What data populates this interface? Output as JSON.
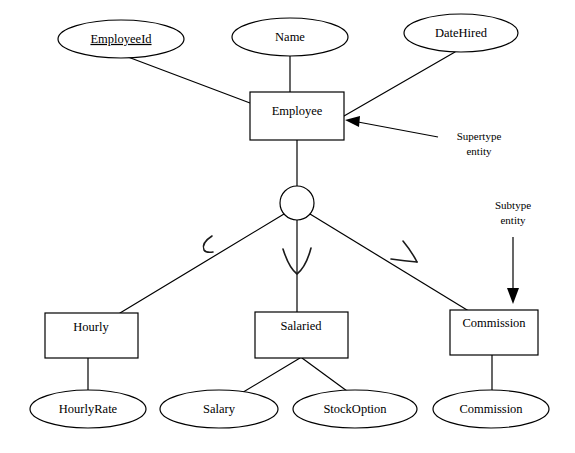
{
  "diagram": {
    "type": "er-diagram",
    "notation": "Chen / supertype-subtype generalization",
    "canvas": {
      "width": 575,
      "height": 453
    },
    "entities": [
      {
        "id": "employee",
        "label": "Employee",
        "role": "supertype",
        "shape": "rectangle",
        "x": 250,
        "y": 92,
        "w": 94,
        "h": 48
      },
      {
        "id": "hourly",
        "label": "Hourly",
        "role": "subtype",
        "shape": "rectangle",
        "x": 45,
        "y": 313,
        "w": 93,
        "h": 45
      },
      {
        "id": "salaried",
        "label": "Salaried",
        "role": "subtype",
        "shape": "rectangle",
        "x": 255,
        "y": 312,
        "w": 93,
        "h": 46
      },
      {
        "id": "commission",
        "label": "Commission",
        "role": "subtype",
        "shape": "rectangle",
        "x": 450,
        "y": 310,
        "w": 88,
        "h": 45
      }
    ],
    "attributes": [
      {
        "id": "employeeid",
        "label": "EmployeeId",
        "key": true,
        "owner": "employee",
        "shape": "ellipse",
        "cx": 121,
        "cy": 39,
        "rx": 63,
        "ry": 19
      },
      {
        "id": "name",
        "label": "Name",
        "key": false,
        "owner": "employee",
        "shape": "ellipse",
        "cx": 290,
        "cy": 37,
        "rx": 58,
        "ry": 19
      },
      {
        "id": "datehired",
        "label": "DateHired",
        "key": false,
        "owner": "employee",
        "shape": "ellipse",
        "cx": 461,
        "cy": 33,
        "rx": 57,
        "ry": 19
      },
      {
        "id": "hourlyrate",
        "label": "HourlyRate",
        "key": false,
        "owner": "hourly",
        "shape": "ellipse",
        "cx": 88,
        "cy": 409,
        "rx": 58,
        "ry": 19
      },
      {
        "id": "salary",
        "label": "Salary",
        "key": false,
        "owner": "salaried",
        "shape": "ellipse",
        "cx": 219,
        "cy": 409,
        "rx": 59,
        "ry": 19
      },
      {
        "id": "stockoption",
        "label": "StockOption",
        "key": false,
        "owner": "salaried",
        "shape": "ellipse",
        "cx": 355,
        "cy": 409,
        "rx": 62,
        "ry": 19
      },
      {
        "id": "commissionattr",
        "label": "Commission",
        "key": false,
        "owner": "commission",
        "shape": "ellipse",
        "cx": 491,
        "cy": 409,
        "rx": 58,
        "ry": 19
      }
    ],
    "generalization": {
      "id": "gen-circle",
      "shape": "circle",
      "cx": 297,
      "cy": 203,
      "r": 17,
      "subtype_marker": "subset-arc"
    },
    "annotations": [
      {
        "id": "supertype-note",
        "line1": "Supertype",
        "line2": "entity",
        "x": 479,
        "y": 143,
        "points_to": "employee"
      },
      {
        "id": "subtype-note",
        "line1": "Subtype",
        "line2": "entity",
        "x": 513,
        "y": 213,
        "points_to": "commission"
      }
    ],
    "colors": {
      "stroke": "#000000",
      "fill": "#ffffff",
      "text": "#000000",
      "background": "#ffffff"
    }
  }
}
